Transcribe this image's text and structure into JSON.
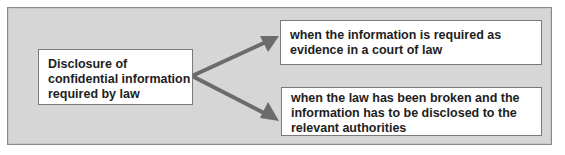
{
  "diagram": {
    "source": {
      "label": "Disclosure of confidential information required by law",
      "lines": [
        "Disclosure of",
        "confidential information",
        "required by law"
      ]
    },
    "targets": [
      {
        "label": "when the information is required as evidence in a court of law",
        "lines": [
          "when the information is required as",
          "evidence in a court of law"
        ]
      },
      {
        "label": "when the law has been broken and the information has to be disclosed to the relevant authorities",
        "lines": [
          "when the law has been broken and the",
          "information has to be disclosed to the",
          "relevant authorities"
        ]
      }
    ],
    "edges": [
      {
        "from": "source",
        "to": "targets.0",
        "icon": "arrow-up-right"
      },
      {
        "from": "source",
        "to": "targets.1",
        "icon": "arrow-down-right"
      }
    ]
  },
  "colors": {
    "panel_background": "#d6d6d6",
    "panel_border": "#8a8a8a",
    "box_background": "#ffffff",
    "box_border": "#7a7a7a",
    "arrow": "#6b6b6b",
    "text": "#1e1e1e"
  }
}
